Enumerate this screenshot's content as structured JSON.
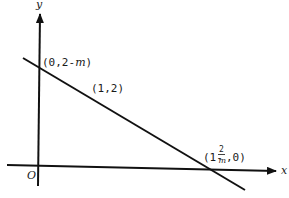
{
  "diagram": {
    "type": "coordinate-plane-line",
    "axes": {
      "x_label": "x",
      "y_label": "y",
      "origin_label": "O"
    },
    "line": {
      "description": "straight line with negative slope through (1,2)"
    },
    "points": {
      "y_intercept": {
        "prefix": "(0,2-",
        "var": "m",
        "suffix": ")"
      },
      "given_point": {
        "text": "(1,2)"
      },
      "x_intercept": {
        "prefix": "(1-",
        "num": "2",
        "den": "m",
        "suffix": ",0)"
      }
    },
    "colors": {
      "stroke": "#111111",
      "background": "#ffffff"
    }
  }
}
